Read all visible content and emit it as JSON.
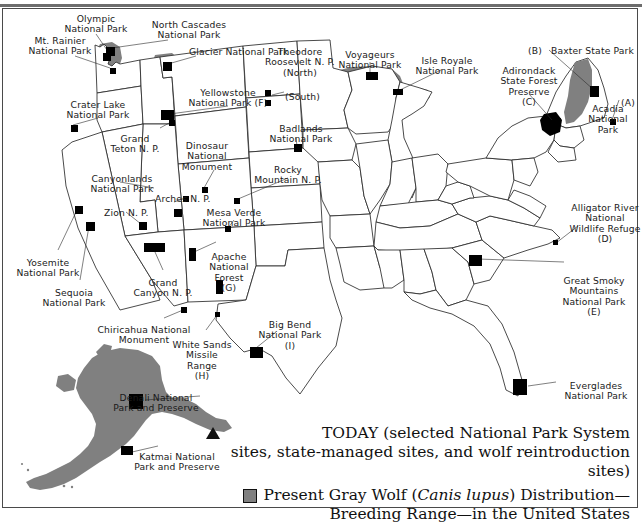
{
  "figure": {
    "frame_color": "#4a4a4a"
  },
  "colors": {
    "wolf_range_gray": "#808080",
    "site_marker_black": "#000000",
    "state_outline": "#2b2b2b",
    "label_text": "#1a1a1a",
    "paper": "#ffffff"
  },
  "legend": {
    "today_symbol": "triangle-up",
    "today_line1": "TODAY (selected National Park System",
    "today_line2": "sites, state-managed sites, and wolf reintroduction sites)",
    "range_symbol": "gray-square",
    "range_line1_pre": "Present Gray Wolf (",
    "range_line1_italic": "Canis lupus",
    "range_line1_post": ") Distribution—",
    "range_line2": "Breeding Range—in the United States"
  },
  "labels": [
    {
      "id": "olympic",
      "text": "Olympic\nNational Park",
      "x": 96,
      "y": 14,
      "align": "c"
    },
    {
      "id": "mt-rainier",
      "text": "Mt. Rainier\nNational Park",
      "x": 60,
      "y": 36,
      "align": "c"
    },
    {
      "id": "north-cascades",
      "text": "North Cascades\nNational Park",
      "x": 189,
      "y": 20,
      "align": "c"
    },
    {
      "id": "glacier",
      "text": "Glacier National Park",
      "x": 189,
      "y": 47,
      "align": "l"
    },
    {
      "id": "crater-lake",
      "text": "Crater Lake\nNational Park",
      "x": 98,
      "y": 100,
      "align": "c"
    },
    {
      "id": "yellowstone",
      "text": "Yellowstone\nNational Park (F)",
      "x": 228,
      "y": 88,
      "align": "c"
    },
    {
      "id": "grand-teton",
      "text": "Grand\nTeton N. P.",
      "x": 135,
      "y": 134,
      "align": "c"
    },
    {
      "id": "theodore-roosevelt",
      "text": "Theodore\nRoosevelt N. P.\n(North)",
      "x": 300,
      "y": 47,
      "align": "c"
    },
    {
      "id": "theodore-south",
      "text": "(South)",
      "x": 285,
      "y": 92,
      "align": "l"
    },
    {
      "id": "voyageurs",
      "text": "Voyageurs\nNational Park",
      "x": 370,
      "y": 50,
      "align": "c"
    },
    {
      "id": "isle-royale",
      "text": "Isle Royale\nNational Park",
      "x": 447,
      "y": 56,
      "align": "c"
    },
    {
      "id": "baxter",
      "text": "Baxter State Park",
      "x": 551,
      "y": 46,
      "align": "l"
    },
    {
      "id": "baxter-key",
      "text": "(B)",
      "x": 528,
      "y": 46,
      "align": "l"
    },
    {
      "id": "adirondack",
      "text": "Adirondack\nState Forest\nPreserve\n(C)",
      "x": 529,
      "y": 66,
      "align": "c"
    },
    {
      "id": "acadia",
      "text": "Acadia\nNational\nPark",
      "x": 608,
      "y": 104,
      "align": "c"
    },
    {
      "id": "acadia-key",
      "text": "(A)",
      "x": 621,
      "y": 98,
      "align": "l"
    },
    {
      "id": "badlands",
      "text": "Badlands\nNational Park",
      "x": 301,
      "y": 124,
      "align": "c"
    },
    {
      "id": "dinosaur",
      "text": "Dinosaur\nNational\nMonument",
      "x": 207,
      "y": 141,
      "align": "c"
    },
    {
      "id": "rocky-mountain",
      "text": "Rocky\nMountain N. P.",
      "x": 288,
      "y": 165,
      "align": "c"
    },
    {
      "id": "canyonlands",
      "text": "Canyonlands\nNational Park",
      "x": 122,
      "y": 174,
      "align": "c"
    },
    {
      "id": "arches",
      "text": "Arches N. P.",
      "x": 155,
      "y": 194,
      "align": "l"
    },
    {
      "id": "zion",
      "text": "Zion N. P.",
      "x": 104,
      "y": 208,
      "align": "l"
    },
    {
      "id": "mesa-verde",
      "text": "Mesa Verde\nNational Park",
      "x": 234,
      "y": 208,
      "align": "c"
    },
    {
      "id": "yosemite",
      "text": "Yosemite\nNational Park",
      "x": 48,
      "y": 258,
      "align": "c"
    },
    {
      "id": "sequoia",
      "text": "Sequoia\nNational Park",
      "x": 74,
      "y": 288,
      "align": "c"
    },
    {
      "id": "grand-canyon",
      "text": "Grand\nCanyon N. P.",
      "x": 163,
      "y": 278,
      "align": "c"
    },
    {
      "id": "apache",
      "text": "Apache\nNational\nForest\n(G)",
      "x": 229,
      "y": 252,
      "align": "c"
    },
    {
      "id": "chiricahua",
      "text": "Chiricahua National\nMonument",
      "x": 144,
      "y": 325,
      "align": "c"
    },
    {
      "id": "white-sands",
      "text": "White Sands\nMissile\nRange\n(H)",
      "x": 202,
      "y": 340,
      "align": "c"
    },
    {
      "id": "big-bend",
      "text": "Big Bend\nNational Park\n(I)",
      "x": 290,
      "y": 320,
      "align": "c"
    },
    {
      "id": "alligator-river",
      "text": "Alligator River\nNational\nWildlife Refuge\n(D)",
      "x": 605,
      "y": 203,
      "align": "c"
    },
    {
      "id": "great-smoky",
      "text": "Great Smoky\nMountains\nNational Park\n(E)",
      "x": 594,
      "y": 276,
      "align": "c"
    },
    {
      "id": "everglades",
      "text": "Everglades\nNational Park",
      "x": 596,
      "y": 381,
      "align": "c"
    },
    {
      "id": "denali",
      "text": "Denali National\nPark and Preserve",
      "x": 156,
      "y": 393,
      "align": "c"
    },
    {
      "id": "katmai",
      "text": "Katmai National\nPark and Preserve",
      "x": 177,
      "y": 452,
      "align": "c"
    }
  ],
  "site_markers": [
    {
      "id": "olympic",
      "x": 103,
      "y": 53,
      "w": 8,
      "h": 8
    },
    {
      "id": "mt-rainier",
      "x": 110,
      "y": 68,
      "w": 6,
      "h": 6
    },
    {
      "id": "north-cascades",
      "x": 106,
      "y": 47,
      "w": 9,
      "h": 9
    },
    {
      "id": "glacier",
      "x": 163,
      "y": 62,
      "w": 9,
      "h": 9
    },
    {
      "id": "crater-lake",
      "x": 71,
      "y": 125,
      "w": 7,
      "h": 7
    },
    {
      "id": "yellowstone",
      "x": 161,
      "y": 110,
      "w": 13,
      "h": 10
    },
    {
      "id": "grand-teton",
      "x": 169,
      "y": 120,
      "w": 6,
      "h": 6
    },
    {
      "id": "theodore-n",
      "x": 265,
      "y": 90,
      "w": 6,
      "h": 6
    },
    {
      "id": "theodore-s",
      "x": 265,
      "y": 100,
      "w": 6,
      "h": 6
    },
    {
      "id": "badlands",
      "x": 294,
      "y": 144,
      "w": 8,
      "h": 8
    },
    {
      "id": "dinosaur",
      "x": 202,
      "y": 187,
      "w": 6,
      "h": 6
    },
    {
      "id": "arches",
      "x": 183,
      "y": 196,
      "w": 6,
      "h": 6
    },
    {
      "id": "canyonlands",
      "x": 174,
      "y": 209,
      "w": 8,
      "h": 8
    },
    {
      "id": "rocky-mountain",
      "x": 234,
      "y": 198,
      "w": 6,
      "h": 6
    },
    {
      "id": "mesa-verde",
      "x": 225,
      "y": 226,
      "w": 6,
      "h": 6
    },
    {
      "id": "zion",
      "x": 139,
      "y": 222,
      "w": 8,
      "h": 8
    },
    {
      "id": "yosemite",
      "x": 75,
      "y": 206,
      "w": 8,
      "h": 8
    },
    {
      "id": "sequoia",
      "x": 86,
      "y": 222,
      "w": 9,
      "h": 9
    },
    {
      "id": "grand-canyon",
      "x": 144,
      "y": 243,
      "w": 21,
      "h": 9
    },
    {
      "id": "apache",
      "x": 189,
      "y": 248,
      "w": 7,
      "h": 13
    },
    {
      "id": "apache-2",
      "x": 216,
      "y": 280,
      "w": 7,
      "h": 14
    },
    {
      "id": "chiricahua",
      "x": 181,
      "y": 307,
      "w": 6,
      "h": 6
    },
    {
      "id": "white-sands",
      "x": 215,
      "y": 312,
      "w": 5,
      "h": 5
    },
    {
      "id": "big-bend",
      "x": 250,
      "y": 347,
      "w": 13,
      "h": 11
    },
    {
      "id": "great-smoky",
      "x": 469,
      "y": 255,
      "w": 13,
      "h": 11
    },
    {
      "id": "alligator-river",
      "x": 553,
      "y": 240,
      "w": 5,
      "h": 5
    },
    {
      "id": "everglades",
      "x": 513,
      "y": 379,
      "w": 14,
      "h": 16
    },
    {
      "id": "acadia",
      "x": 610,
      "y": 119,
      "w": 6,
      "h": 6
    },
    {
      "id": "baxter",
      "x": 590,
      "y": 86,
      "w": 9,
      "h": 11
    },
    {
      "id": "adirondack",
      "x": 553,
      "y": 118,
      "w": 8,
      "h": 8
    },
    {
      "id": "voyageurs",
      "x": 366,
      "y": 72,
      "w": 12,
      "h": 8
    },
    {
      "id": "isle-royale",
      "x": 393,
      "y": 89,
      "w": 10,
      "h": 6
    },
    {
      "id": "denali",
      "x": 129,
      "y": 394,
      "w": 14,
      "h": 15
    },
    {
      "id": "katmai",
      "x": 121,
      "y": 446,
      "w": 12,
      "h": 9
    }
  ],
  "wolf_range_regions": [
    {
      "id": "north-cascades-range",
      "label": "North Cascades / Washington"
    },
    {
      "id": "glacier-range",
      "label": "Glacier / northwest Montana"
    },
    {
      "id": "great-lakes-range",
      "label": "Minnesota, Wisconsin, Upper Michigan"
    },
    {
      "id": "maine-range",
      "label": "Northern Maine"
    },
    {
      "id": "alaska-range",
      "label": "Alaska (statewide)"
    }
  ],
  "insets": [
    {
      "id": "alaska-inset",
      "name": "Alaska"
    }
  ]
}
